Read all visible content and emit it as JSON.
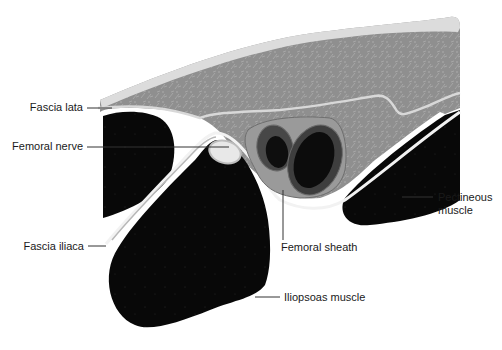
{
  "diagram": {
    "type": "anatomical-cross-section",
    "colors": {
      "muscle": "#0a0a0a",
      "tissue": "#8e8e8e",
      "tissue_texture": "#a3a3a3",
      "skin": "#dcdcdc",
      "fascia": "#d4d4d4",
      "nerve": "#e6e6e6",
      "vessel_outer": "#4a4a4a",
      "vessel_inner": "#101010",
      "leader_line": "#333333"
    },
    "labels": [
      {
        "id": "fascia-lata",
        "text": "Fascia lata",
        "side": "left"
      },
      {
        "id": "femoral-nerve",
        "text": "Femoral nerve",
        "side": "left"
      },
      {
        "id": "fascia-iliaca",
        "text": "Fascia iliaca",
        "side": "left"
      },
      {
        "id": "femoral-sheath",
        "text": "Femoral sheath",
        "side": "bottom"
      },
      {
        "id": "pectineous-muscle",
        "text": "Pectineous muscle",
        "line1": "Pectineous",
        "line2": "muscle",
        "side": "right"
      },
      {
        "id": "iliopsoas-muscle",
        "text": "Iliopsoas muscle",
        "side": "right"
      }
    ]
  }
}
